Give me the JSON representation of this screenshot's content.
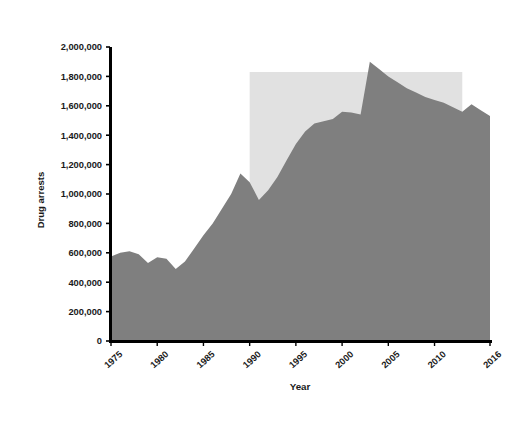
{
  "figure": {
    "border_color": "#b9b9b9",
    "background": "#ffffff"
  },
  "chart_data": {
    "type": "area",
    "title": "",
    "xlabel": "Year",
    "ylabel": "Drug arrests",
    "xlim": [
      1975,
      2016
    ],
    "ylim": [
      0,
      2000000
    ],
    "grid": false,
    "legend": "none",
    "area_color": "#7f7f7f",
    "highlight_color": "#e1e1e1",
    "axis_color": "#000000",
    "xticks": [
      1975,
      1980,
      1985,
      1990,
      1995,
      2000,
      2005,
      2010,
      2016
    ],
    "xtick_labels": [
      "1975",
      "1980",
      "1985",
      "1990",
      "1995",
      "2000",
      "2005",
      "2010",
      "2016"
    ],
    "yticks": [
      0,
      200000,
      400000,
      600000,
      800000,
      1000000,
      1200000,
      1400000,
      1600000,
      1800000,
      2000000
    ],
    "ytick_labels": [
      "0",
      "200,000",
      "400,000",
      "600,000",
      "800,000",
      "1,000,000",
      "1,200,000",
      "1,400,000",
      "1,600,000",
      "1,800,000",
      "2,000,000"
    ],
    "highlight_rect": {
      "x_start": 1990,
      "x_end": 2013,
      "y_top": 1830000,
      "y_bottom": 0
    },
    "x": [
      1975,
      1976,
      1977,
      1978,
      1979,
      1980,
      1981,
      1982,
      1983,
      1984,
      1985,
      1986,
      1987,
      1988,
      1989,
      1990,
      1991,
      1992,
      1993,
      1994,
      1995,
      1996,
      1997,
      1998,
      1999,
      2000,
      2001,
      2002,
      2003,
      2004,
      2005,
      2006,
      2007,
      2008,
      2009,
      2010,
      2011,
      2012,
      2013,
      2014,
      2015,
      2016
    ],
    "values": [
      575000,
      600000,
      610000,
      590000,
      530000,
      570000,
      560000,
      490000,
      540000,
      630000,
      720000,
      800000,
      900000,
      1000000,
      1140000,
      1080000,
      960000,
      1025000,
      1115000,
      1230000,
      1340000,
      1425000,
      1480000,
      1495000,
      1510000,
      1560000,
      1555000,
      1540000,
      1900000,
      1850000,
      1800000,
      1760000,
      1720000,
      1690000,
      1660000,
      1640000,
      1620000,
      1590000,
      1560000,
      1610000,
      1570000,
      1530000
    ],
    "series_name": "Drug arrests"
  }
}
